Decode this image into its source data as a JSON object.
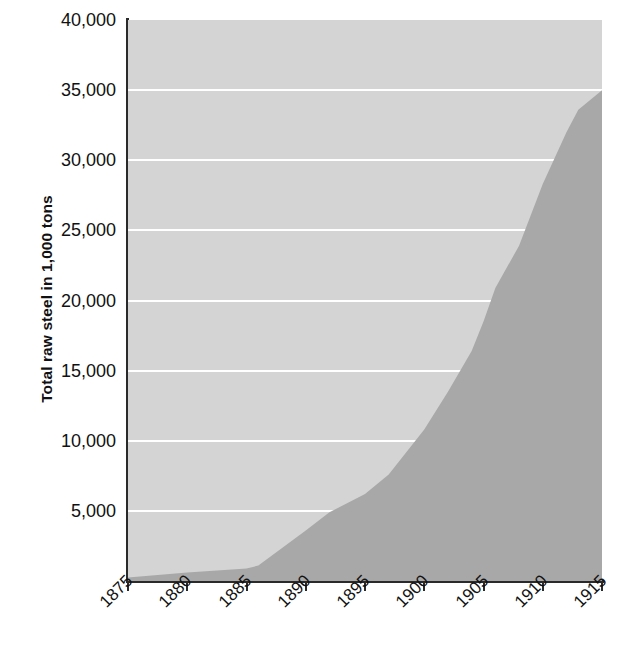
{
  "chart_data": {
    "type": "area",
    "title": "",
    "xlabel": "",
    "ylabel": "Total raw steel in 1,000 tons",
    "xlim": [
      1875,
      1915
    ],
    "ylim": [
      0,
      40000
    ],
    "grid": true,
    "legend_position": "none",
    "x_tick_labels": [
      "1875",
      "1880",
      "1885",
      "1890",
      "1895",
      "1900",
      "1905",
      "1910",
      "1915"
    ],
    "x_ticks": [
      1875,
      1880,
      1885,
      1890,
      1895,
      1900,
      1905,
      1910,
      1915
    ],
    "y_tick_labels": [
      "5,000",
      "10,000",
      "15,000",
      "20,000",
      "25,000",
      "30,000",
      "35,000",
      "40,000"
    ],
    "y_ticks": [
      5000,
      10000,
      15000,
      20000,
      25000,
      30000,
      35000,
      40000
    ],
    "colors": {
      "plot_background": "#d4d4d4",
      "area_fill": "#a8a8a8",
      "gridline": "#ffffff",
      "axis": "#2a2a2a",
      "text": "#111111"
    },
    "series": [
      {
        "name": "Total raw steel",
        "x": [
          1875,
          1880,
          1885,
          1886,
          1890,
          1892,
          1895,
          1897,
          1900,
          1902,
          1904,
          1905,
          1906,
          1908,
          1910,
          1912,
          1913,
          1915
        ],
        "values": [
          250,
          600,
          900,
          1100,
          3600,
          4900,
          6200,
          7600,
          10800,
          13500,
          16400,
          18500,
          20900,
          23900,
          28300,
          32000,
          33600,
          35000
        ]
      }
    ]
  }
}
